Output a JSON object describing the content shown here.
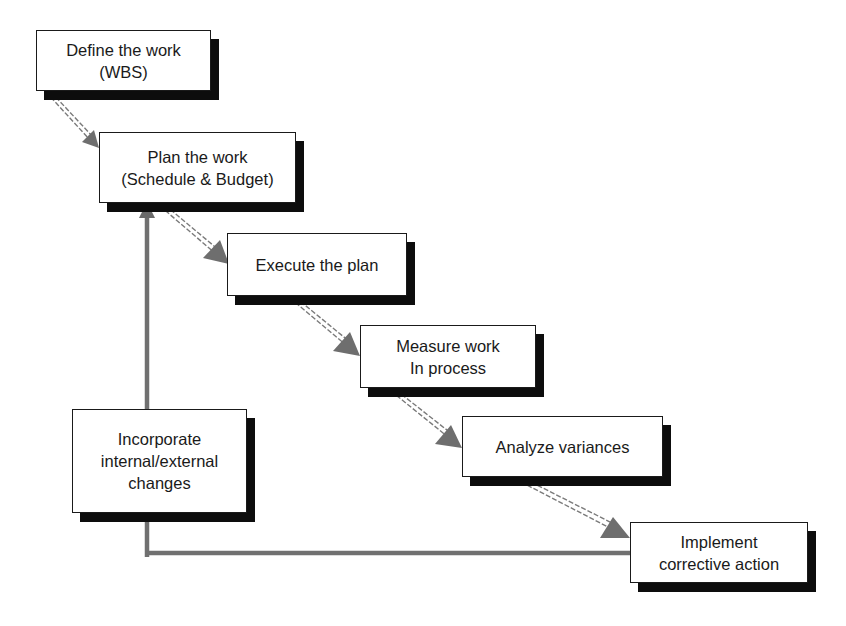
{
  "diagram": {
    "type": "process-flow",
    "colors": {
      "box_border": "#1a1a1a",
      "box_shadow": "#0d0d0d",
      "arrow": "#6e6e6e",
      "background": "#ffffff"
    },
    "nodes": [
      {
        "id": "define",
        "label": "Define the work\n(WBS)"
      },
      {
        "id": "plan",
        "label": "Plan the work\n(Schedule & Budget)"
      },
      {
        "id": "execute",
        "label": "Execute the plan"
      },
      {
        "id": "measure",
        "label": "Measure work\nIn process"
      },
      {
        "id": "analyze",
        "label": "Analyze variances"
      },
      {
        "id": "implement",
        "label": "Implement\ncorrective action"
      },
      {
        "id": "incorporate",
        "label": "Incorporate\ninternal/external\nchanges"
      }
    ],
    "edges": [
      {
        "from": "define",
        "to": "plan"
      },
      {
        "from": "plan",
        "to": "execute"
      },
      {
        "from": "execute",
        "to": "measure"
      },
      {
        "from": "measure",
        "to": "analyze"
      },
      {
        "from": "analyze",
        "to": "implement"
      },
      {
        "from": "implement",
        "to": "incorporate",
        "style": "feedback"
      },
      {
        "from": "incorporate",
        "to": "plan",
        "style": "feedback"
      }
    ]
  }
}
